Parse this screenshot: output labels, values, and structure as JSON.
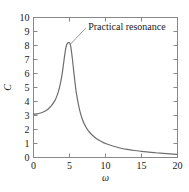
{
  "chart_data": {
    "type": "line",
    "title": "",
    "xlabel": "ω",
    "ylabel": "C",
    "xlim": [
      0,
      20
    ],
    "ylim": [
      0,
      10
    ],
    "grid": false,
    "legend": null,
    "xticks": [
      "0",
      "5",
      "10",
      "15",
      "20"
    ],
    "xtick_values": [
      0,
      5,
      10,
      15,
      20
    ],
    "yticks": [
      "0",
      "1",
      "2",
      "3",
      "4",
      "5",
      "6",
      "7",
      "8",
      "9",
      "10"
    ],
    "ytick_values": [
      0,
      1,
      2,
      3,
      4,
      5,
      6,
      7,
      8,
      9,
      10
    ],
    "series": [
      {
        "name": "C(ω)",
        "color": "#6e6e6e",
        "x": [
          0.0,
          0.5,
          1.0,
          1.5,
          2.0,
          2.5,
          3.0,
          3.2,
          3.4,
          3.6,
          3.8,
          4.0,
          4.2,
          4.4,
          4.6,
          4.8,
          4.9,
          5.0,
          5.1,
          5.2,
          5.4,
          5.6,
          5.8,
          6.0,
          6.4,
          6.8,
          7.2,
          7.6,
          8.0,
          8.5,
          9.0,
          9.5,
          10.0,
          11.0,
          12.0,
          13.0,
          14.0,
          15.0,
          16.0,
          17.0,
          18.0,
          19.0,
          20.0
        ],
        "y": [
          3.1,
          3.12,
          3.18,
          3.28,
          3.45,
          3.7,
          4.1,
          4.33,
          4.62,
          4.98,
          5.45,
          6.05,
          6.8,
          7.55,
          8.05,
          8.2,
          8.21,
          8.2,
          8.1,
          7.85,
          7.05,
          6.1,
          5.2,
          4.45,
          3.4,
          2.7,
          2.25,
          1.92,
          1.68,
          1.45,
          1.26,
          1.12,
          1.0,
          0.82,
          0.68,
          0.58,
          0.5,
          0.44,
          0.39,
          0.34,
          0.3,
          0.26,
          0.22
        ]
      }
    ],
    "annotations": [
      {
        "text": "Practical resonance",
        "target_x": 5.0,
        "target_y": 8.2,
        "label_x": 7.6,
        "label_y": 9.35
      }
    ],
    "peak": {
      "x": 5.0,
      "y": 8.2
    },
    "colors": {
      "curve": "#6e6e6e",
      "axis": "#888888",
      "text": "#1a1a1a",
      "background": "#ffffff"
    }
  }
}
